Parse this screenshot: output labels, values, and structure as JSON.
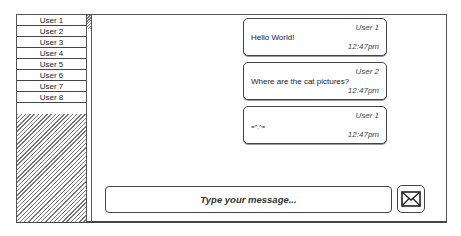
{
  "sidebar": {
    "users": [
      "User 1",
      "User 2",
      "User 3",
      "User 4",
      "User 5",
      "User 6",
      "User 7",
      "User 8"
    ]
  },
  "messages": [
    {
      "user": "User 1",
      "text": "Hello World!",
      "time": "12:47pm"
    },
    {
      "user": "User 2",
      "text": "Where are the cat pictures?",
      "time": "12:47pm"
    },
    {
      "user": "User 1",
      "text": "=^.^=",
      "time": "12:47pm"
    }
  ],
  "composer": {
    "placeholder": "Type your message...",
    "send_icon": "envelope-icon"
  }
}
